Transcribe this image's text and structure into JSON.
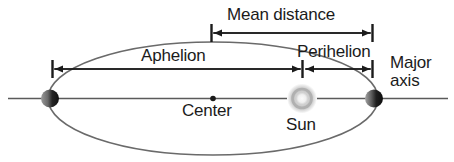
{
  "diagram": {
    "canvas": {
      "width": 454,
      "height": 162,
      "background": "#ffffff"
    },
    "stroke_color": "#555555",
    "annotation_color": "#1b1b1b",
    "labels": {
      "mean_distance": "Mean distance",
      "aphelion": "Aphelion",
      "perihelion": "Perihelion",
      "major_axis_line1": "Major",
      "major_axis_line2": "axis",
      "center": "Center",
      "sun": "Sun"
    },
    "icons": {
      "planet_aphelion": "planet-icon",
      "planet_perihelion": "planet-icon",
      "sun": "sun-icon",
      "center_point": "center-dot-icon"
    },
    "geometry": {
      "ellipse": {
        "cx": 213,
        "cy": 98.5,
        "rx": 165,
        "ry": 56.5
      },
      "major_axis_line": {
        "x1": 8,
        "y1": 98.5,
        "x2": 448,
        "y2": 98.5
      },
      "center_dot": {
        "cx": 213,
        "cy": 98.5,
        "r": 2.6
      },
      "sun": {
        "cx": 302,
        "cy": 98.5,
        "r": 12
      },
      "planet_aphelion": {
        "cx": 50,
        "cy": 98.5,
        "r": 9
      },
      "planet_perihelion": {
        "cx": 374,
        "cy": 98.5,
        "r": 9
      },
      "mean_distance_arrow": {
        "x1": 211,
        "x2": 372,
        "y": 33
      },
      "aphelion_arrow": {
        "x1": 52,
        "x2": 301,
        "y": 69
      },
      "perihelion_arrow": {
        "x1": 305,
        "x2": 372,
        "y": 69
      }
    }
  }
}
